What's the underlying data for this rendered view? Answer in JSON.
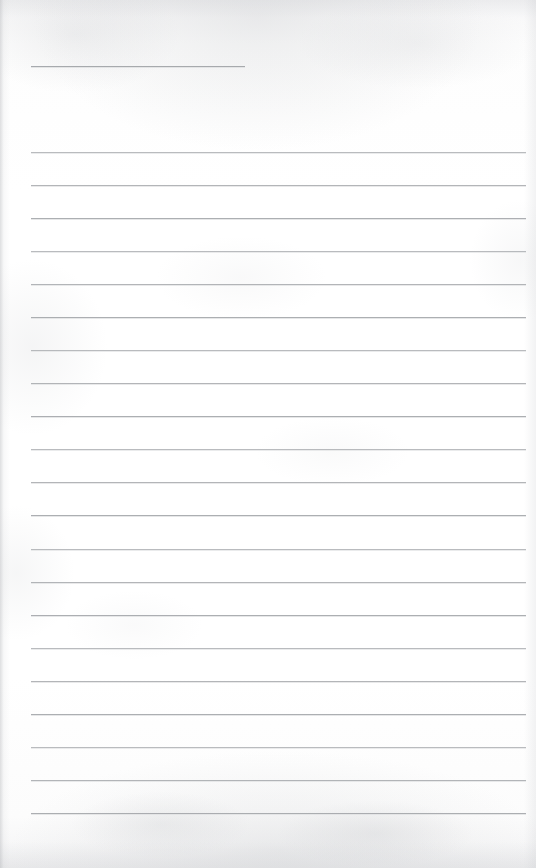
{
  "document": {
    "kind": "scanned-lined-notepad-page",
    "title": "Blank ruled notepad page",
    "page_width": 536,
    "page_height": 868,
    "background_color": "#fdfdfd",
    "rule_color": "#9fa2a6",
    "text_content": "",
    "has_handwriting": false,
    "has_printed_text": false
  },
  "header_rule": {
    "label": "header-short-rule",
    "x": 31,
    "y": 66,
    "width": 214,
    "end_x": 245
  },
  "ruled_lines": {
    "count": 21,
    "left_x": 31,
    "right_x": 526,
    "width": 495,
    "first_y": 152,
    "last_y": 813,
    "spacing": 33.05,
    "positions": [
      152,
      185,
      218,
      251,
      284,
      317,
      350,
      383,
      416,
      449,
      482,
      515,
      549,
      582,
      615,
      648,
      681,
      714,
      747,
      780,
      813
    ]
  },
  "margins": {
    "top_blank_height": 66,
    "gap_after_header": 86,
    "bottom_blank_height": 55
  }
}
